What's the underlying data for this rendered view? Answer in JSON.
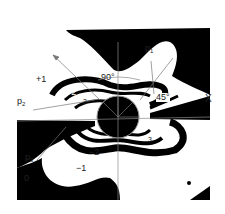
{
  "figure": {
    "colors": {
      "fringe": "#000000",
      "background": "#ffffff",
      "axis": "#8a8a8a",
      "label": "#222222"
    },
    "labels": {
      "angle_90": "90°",
      "angle_45": "45°",
      "axis_x": "X",
      "p1_base": "p",
      "p1_sub": "1",
      "p2_base": "p",
      "p2_sub": "2",
      "p3_base": "p",
      "p3_sub": "3",
      "fringe_plus1": "+1",
      "fringe_plus2": "+2",
      "fringe_plus3": "3",
      "fringe_minus1": "−1",
      "fringe_minus2": "−2",
      "fringe_minus3": "3",
      "fringe_zero": "0"
    }
  }
}
